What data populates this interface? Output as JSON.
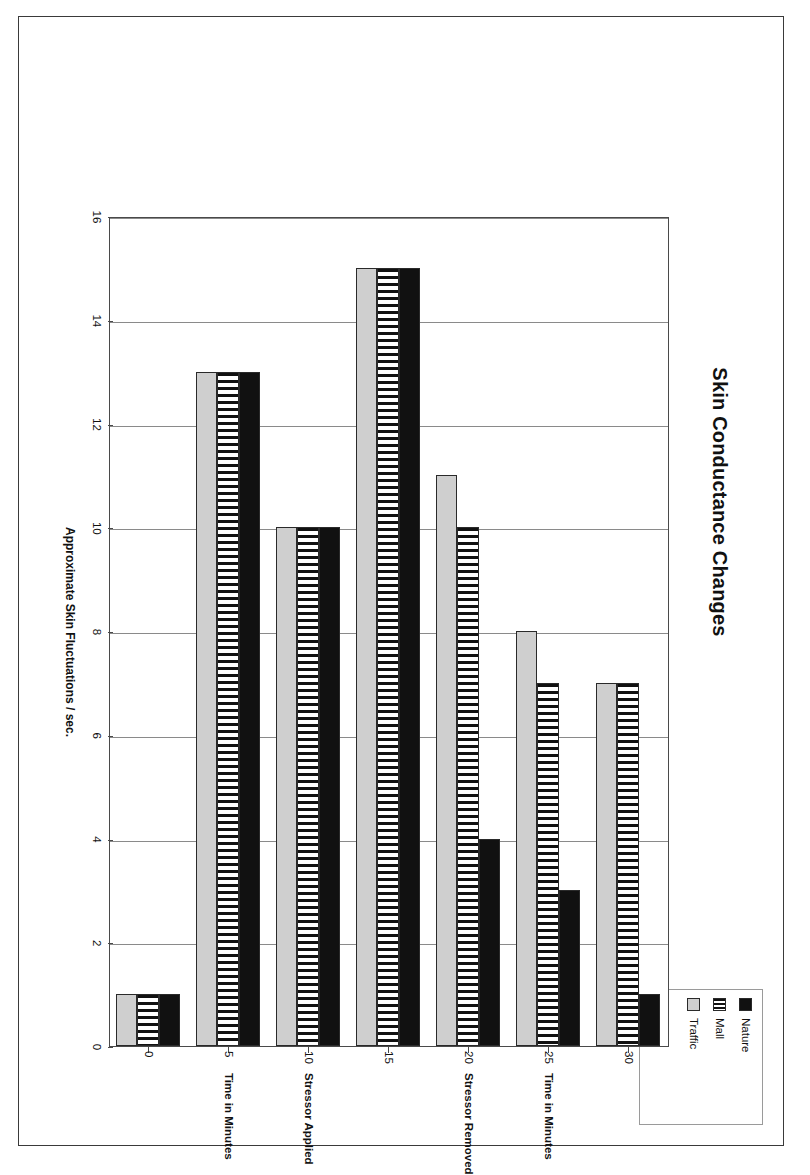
{
  "chart_data": {
    "type": "bar",
    "orientation": "horizontal",
    "title": "Skin Conductance Changes",
    "xlabel": "Approximate Skin Fluctuations / sec.",
    "ylabel": "Time in Minutes",
    "categories": [
      "0",
      "5",
      "10",
      "15",
      "20",
      "25",
      "30"
    ],
    "category_annotations": [
      "",
      "Time in Minutes",
      "Stressor Applied",
      "",
      "Stressor Removed",
      "Time in Minutes",
      ""
    ],
    "series": [
      {
        "name": "Nature",
        "color": "#111111",
        "pattern": "solid-black",
        "values": [
          1,
          13,
          10,
          15,
          4,
          3,
          1
        ]
      },
      {
        "name": "Mall",
        "color": "#111111",
        "pattern": "vertical-stripes",
        "values": [
          1,
          13,
          10,
          15,
          10,
          7,
          7
        ]
      },
      {
        "name": "Traffic",
        "color": "#cfcfcf",
        "pattern": "solid-light-gray",
        "values": [
          1,
          13,
          10,
          15,
          11,
          8,
          7
        ]
      }
    ],
    "value_ticks": [
      "0",
      "2",
      "4",
      "6",
      "8",
      "10",
      "12",
      "14",
      "16"
    ],
    "vlim": [
      0,
      16
    ],
    "grid": true,
    "legend_position": "top-right",
    "legend": [
      "Nature",
      "Mall",
      "Traffic"
    ]
  },
  "legend": {
    "items": [
      {
        "label": "Nature",
        "swatch": "legend-swatch-nature"
      },
      {
        "label": "Mall",
        "swatch": "legend-swatch-mall"
      },
      {
        "label": "Traffic",
        "swatch": "legend-swatch-traffic"
      }
    ]
  }
}
